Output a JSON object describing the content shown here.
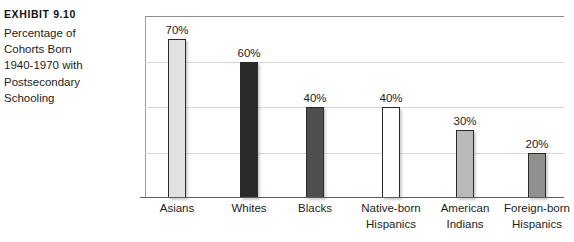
{
  "caption": {
    "exhibit_label": "Exhibit 9.10",
    "lines": [
      "Percentage of",
      "Cohorts Born",
      "1940-1970 with",
      "Postsecondary",
      "Schooling"
    ]
  },
  "chart_data": {
    "type": "bar",
    "title": "Percentage of Cohorts Born 1940-1970 with Postsecondary Schooling",
    "xlabel": "",
    "ylabel": "",
    "ylim": [
      0,
      80
    ],
    "grid": true,
    "gridlines": [
      20,
      40,
      60,
      80
    ],
    "legend": "none",
    "categories": [
      "Asians",
      "Whites",
      "Blacks",
      "Native-born Hispanics",
      "American Indians",
      "Foreign-born Hispanics"
    ],
    "category_lines": [
      [
        "Asians"
      ],
      [
        "Whites"
      ],
      [
        "Blacks"
      ],
      [
        "Native-born",
        "Hispanics"
      ],
      [
        "American",
        "Indians"
      ],
      [
        "Foreign-born",
        "Hispanics"
      ]
    ],
    "values": [
      70,
      60,
      40,
      40,
      30,
      20
    ],
    "value_labels": [
      "70%",
      "60%",
      "40%",
      "40%",
      "30%",
      "20%"
    ],
    "bar_colors": [
      "#e2e2e0",
      "#2b2b2b",
      "#4f4f4f",
      "#ffffff",
      "#b9b9b7",
      "#8f8f8d"
    ],
    "bar_border_color": "#2b2b2b"
  }
}
